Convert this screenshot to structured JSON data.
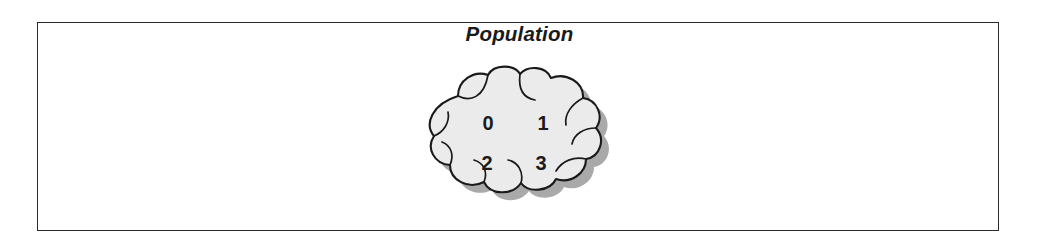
{
  "figure": {
    "background_color": "#ffffff",
    "frame": {
      "border_color": "#2b2b2b",
      "fill_color": "#ffffff"
    }
  },
  "diagram": {
    "title": "Population",
    "cloud": {
      "icon_name": "cloud-shape",
      "fill_color": "#ebebeb",
      "outline_color": "#1a1a1a",
      "shadow_color": "#9a9a9a",
      "elements": [
        {
          "label": "0"
        },
        {
          "label": "1"
        },
        {
          "label": "2"
        },
        {
          "label": "3"
        }
      ]
    }
  }
}
